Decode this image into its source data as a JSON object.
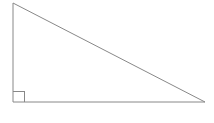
{
  "figure": {
    "kind": "geometry-figure",
    "name": "right-triangle",
    "canvas": {
      "width": 214,
      "height": 123,
      "background_color": "#ffffff"
    },
    "style": {
      "stroke_color": "#888888",
      "stroke_width": 1,
      "fill": "none",
      "fill_color": "#ffffff"
    },
    "vertices": [
      {
        "label": "apex",
        "x": 13,
        "y": 3
      },
      {
        "label": "right-angle",
        "x": 13,
        "y": 102
      },
      {
        "label": "base-right",
        "x": 205,
        "y": 102
      }
    ],
    "polygon_points": "13,3 13,102 205,102",
    "edges": [
      {
        "name": "vertical-leg",
        "from": "apex",
        "to": "right-angle"
      },
      {
        "name": "horizontal-leg",
        "from": "right-angle",
        "to": "base-right"
      },
      {
        "name": "hypotenuse",
        "from": "base-right",
        "to": "apex"
      }
    ],
    "right_angle_marker": {
      "at_vertex": "right-angle",
      "size": 11,
      "stroke_color": "#888888",
      "stroke_width": 1,
      "fill": "none",
      "path": "M 24,102 L 24,91 L 13,91"
    },
    "labels": []
  }
}
